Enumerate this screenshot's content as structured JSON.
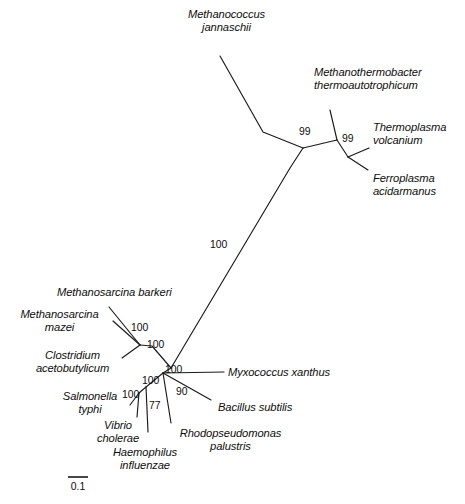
{
  "figure": {
    "type": "phylogenetic-tree",
    "style": "unrooted-radial",
    "background_color": "#ffffff",
    "line_color": "#1a1a1a",
    "text_color": "#0d0d0d"
  },
  "scale_bar": {
    "label": "0.1",
    "length_px": 20,
    "x": 68,
    "y": 477
  },
  "taxa": [
    {
      "id": "methanococcus-jannaschii",
      "lines": [
        "Methanococcus",
        "jannaschii"
      ],
      "label": "Methanococcus jannaschii",
      "align": "center",
      "x": 169,
      "y": 8,
      "width": 115,
      "tip": {
        "x": 220,
        "y": 56
      }
    },
    {
      "id": "methanothermobacter-thermoautotrophicum",
      "lines": [
        "Methanothermobacter",
        "thermoautotrophicum"
      ],
      "label": "Methanothermobacter thermoautotrophicum",
      "align": "left",
      "x": 314,
      "y": 66,
      "width": 145,
      "tip": {
        "x": 330,
        "y": 110
      }
    },
    {
      "id": "thermoplasma-volcanium",
      "lines": [
        "Thermoplasma",
        "volcanium"
      ],
      "label": "Thermoplasma volcanium",
      "align": "left",
      "x": 373,
      "y": 121,
      "width": 88,
      "tip": {
        "x": 369,
        "y": 148
      }
    },
    {
      "id": "ferroplasma-acidarmanus",
      "lines": [
        "Ferroplasma",
        "acidarmanus"
      ],
      "label": "Ferroplasma acidarmanus",
      "align": "left",
      "x": 373,
      "y": 172,
      "width": 88,
      "tip": {
        "x": 368,
        "y": 170
      }
    },
    {
      "id": "methanosarcina-barkeri",
      "lines": [
        "Methanosarcina barkeri"
      ],
      "label": "Methanosarcina barkeri",
      "align": "left",
      "x": 57,
      "y": 286,
      "width": 140,
      "tip": {
        "x": 109,
        "y": 307
      }
    },
    {
      "id": "methanosarcina-mazei",
      "lines": [
        "Methanosarcina",
        "mazei"
      ],
      "label": "Methanosarcina mazei",
      "align": "center",
      "x": 8,
      "y": 308,
      "width": 103,
      "tip": {
        "x": 113,
        "y": 321
      }
    },
    {
      "id": "clostridium-acetobutylicum",
      "lines": [
        "Clostridium",
        "acetobutylicum"
      ],
      "label": "Clostridium acetobutylicum",
      "align": "center",
      "x": 26,
      "y": 349,
      "width": 93,
      "tip": {
        "x": 122,
        "y": 358
      }
    },
    {
      "id": "myxococcus-xanthus",
      "lines": [
        "Myxococcus xanthus"
      ],
      "label": "Myxococcus xanthus",
      "align": "left",
      "x": 228,
      "y": 366,
      "width": 120,
      "tip": {
        "x": 224,
        "y": 372
      }
    },
    {
      "id": "bacillus-subtilis",
      "lines": [
        "Bacillus subtilis"
      ],
      "label": "Bacillus subtilis",
      "align": "left",
      "x": 218,
      "y": 401,
      "width": 92,
      "tip": {
        "x": 211,
        "y": 400
      }
    },
    {
      "id": "salmonella-typhi",
      "lines": [
        "Salmonella",
        "typhi"
      ],
      "label": "Salmonella typhi",
      "align": "center",
      "x": 57,
      "y": 390,
      "width": 66,
      "tip": {
        "x": 130,
        "y": 405
      }
    },
    {
      "id": "vibrio-cholerae",
      "lines": [
        "Vibrio",
        "cholerae"
      ],
      "label": "Vibrio cholerae",
      "align": "center",
      "x": 88,
      "y": 419,
      "width": 60,
      "tip": {
        "x": 137,
        "y": 417
      }
    },
    {
      "id": "haemophilus-influenzae",
      "lines": [
        "Haemophilus",
        "influenzae"
      ],
      "label": "Haemophilus influenzae",
      "align": "center",
      "x": 104,
      "y": 446,
      "width": 82,
      "tip": {
        "x": 148,
        "y": 432
      }
    },
    {
      "id": "rhodopseudomonas-palustris",
      "lines": [
        "Rhodopseudomonas",
        "palustris"
      ],
      "label": "Rhodopseudomonas palustris",
      "align": "center",
      "x": 168,
      "y": 427,
      "width": 125,
      "tip": {
        "x": 171,
        "y": 423
      }
    }
  ],
  "support_values": [
    {
      "id": "support-archaea-upper",
      "value": "99",
      "x": 299,
      "y": 126
    },
    {
      "id": "support-thermoplasmatales",
      "value": "99",
      "x": 342,
      "y": 133
    },
    {
      "id": "support-bacteria-archaea-split",
      "value": "100",
      "x": 210,
      "y": 239
    },
    {
      "id": "support-methanosarcina",
      "value": "100",
      "x": 131,
      "y": 322
    },
    {
      "id": "support-methanosarcina-clade",
      "value": "100",
      "x": 147,
      "y": 339
    },
    {
      "id": "support-myxococcus",
      "value": "100",
      "x": 165,
      "y": 364
    },
    {
      "id": "support-core-node",
      "value": "100",
      "x": 142,
      "y": 375
    },
    {
      "id": "support-bacillus",
      "value": "90",
      "x": 176,
      "y": 386
    },
    {
      "id": "support-enterobacteria",
      "value": "100",
      "x": 122,
      "y": 389
    },
    {
      "id": "support-gammaproteobacteria",
      "value": "77",
      "x": 149,
      "y": 400
    }
  ],
  "branches": [
    {
      "id": "br-jannaschii",
      "path": "M 220,56 L 263,132 L 303,148"
    },
    {
      "id": "br-methanothermo",
      "path": "M 330,110 L 337,140"
    },
    {
      "id": "br-archaea-internal",
      "path": "M 303,148 L 337,140"
    },
    {
      "id": "br-thermoplasmatales",
      "path": "M 337,140 L 348,157"
    },
    {
      "id": "br-thermoplasma",
      "path": "M 348,157 L 369,148"
    },
    {
      "id": "br-ferroplasma",
      "path": "M 348,157 L 368,170"
    },
    {
      "id": "br-long-trunk",
      "path": "M 303,148 L 290,168 L 171,368"
    },
    {
      "id": "br-msarcina-node",
      "path": "M 171,368 L 152,346 L 140,345"
    },
    {
      "id": "br-mbarkeri",
      "path": "M 140,345 L 109,307"
    },
    {
      "id": "br-mmazei",
      "path": "M 140,345 L 113,321"
    },
    {
      "id": "br-clostridium",
      "path": "M 140,345 L 122,358"
    },
    {
      "id": "br-core",
      "path": "M 171,368 L 163,373"
    },
    {
      "id": "br-myxococcus",
      "path": "M 163,373 L 224,372"
    },
    {
      "id": "br-bacillus",
      "path": "M 163,373 L 211,400"
    },
    {
      "id": "br-rhodopseudomonas",
      "path": "M 163,373 L 171,423"
    },
    {
      "id": "br-entero-stem",
      "path": "M 163,373 L 146,387"
    },
    {
      "id": "br-haemophilus",
      "path": "M 146,387 L 148,432"
    },
    {
      "id": "br-entero-node",
      "path": "M 146,387 L 139,393"
    },
    {
      "id": "br-salmonella",
      "path": "M 139,393 L 130,405"
    },
    {
      "id": "br-vibrio",
      "path": "M 139,393 L 137,417"
    }
  ]
}
